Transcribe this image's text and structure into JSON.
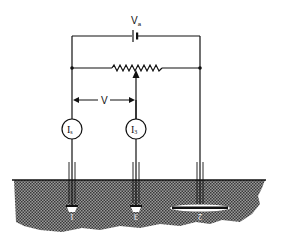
{
  "figure": {
    "type": "earth resistance measurement circuit (fall-of-potential method)",
    "labels": {
      "source": "V",
      "source_sub": "a",
      "voltage": "V",
      "ammeter_1": "I",
      "ammeter_1_sub": "s",
      "ammeter_2": "I",
      "ammeter_2_sub": "3",
      "electrode_1": "1",
      "electrode_2": "3",
      "electrode_3": "2"
    },
    "colors": {
      "line": "#111111",
      "soil": "#5a5a5a",
      "background": "#ffffff"
    }
  }
}
